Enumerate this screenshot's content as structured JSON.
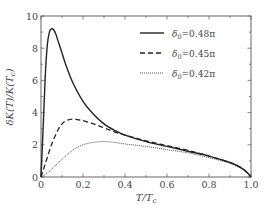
{
  "chart_data": {
    "type": "line",
    "title": "",
    "xlabel": "T/T_c",
    "ylabel": "δK(T)/K(T_c)",
    "xlim": [
      0,
      1.0
    ],
    "ylim": [
      0,
      10
    ],
    "xticks": [
      "0",
      "0.2",
      "0.4",
      "0.6",
      "0.8",
      "1.0"
    ],
    "yticks": [
      "0",
      "2",
      "4",
      "6",
      "8",
      "10"
    ],
    "grid": false,
    "legend_position": "upper right",
    "series": [
      {
        "name": "δ0=0.48π",
        "style": "solid",
        "x": [
          0,
          0.01,
          0.02,
          0.03,
          0.04,
          0.05,
          0.06,
          0.07,
          0.08,
          0.1,
          0.12,
          0.15,
          0.2,
          0.25,
          0.3,
          0.35,
          0.4,
          0.5,
          0.6,
          0.7,
          0.8,
          0.9,
          0.95,
          0.98,
          1.0
        ],
        "y": [
          0,
          3.0,
          6.2,
          8.2,
          9.0,
          9.2,
          9.15,
          8.9,
          8.5,
          7.7,
          6.9,
          5.9,
          4.7,
          3.9,
          3.3,
          2.9,
          2.6,
          2.2,
          1.9,
          1.6,
          1.3,
          0.9,
          0.6,
          0.3,
          0
        ]
      },
      {
        "name": "δ0=0.45π",
        "style": "dashed",
        "x": [
          0,
          0.02,
          0.05,
          0.08,
          0.1,
          0.12,
          0.15,
          0.18,
          0.2,
          0.25,
          0.3,
          0.35,
          0.4,
          0.5,
          0.6,
          0.7,
          0.8,
          0.9,
          0.95,
          0.98,
          1.0
        ],
        "y": [
          0,
          0.8,
          2.0,
          2.9,
          3.3,
          3.5,
          3.6,
          3.55,
          3.5,
          3.3,
          3.05,
          2.8,
          2.6,
          2.25,
          1.95,
          1.65,
          1.3,
          0.9,
          0.6,
          0.3,
          0
        ]
      },
      {
        "name": "δ0=0.42π",
        "style": "dotted",
        "x": [
          0,
          0.03,
          0.06,
          0.1,
          0.15,
          0.2,
          0.25,
          0.3,
          0.35,
          0.4,
          0.5,
          0.6,
          0.7,
          0.8,
          0.9,
          0.95,
          0.98,
          1.0
        ],
        "y": [
          0,
          0.25,
          0.6,
          1.1,
          1.65,
          2.0,
          2.15,
          2.2,
          2.15,
          2.05,
          1.9,
          1.7,
          1.5,
          1.2,
          0.85,
          0.55,
          0.3,
          0
        ]
      }
    ]
  },
  "legend": {
    "entries": [
      {
        "label": "δ",
        "sub": "0",
        "value": "=0.48π"
      },
      {
        "label": "δ",
        "sub": "0",
        "value": "=0.45π"
      },
      {
        "label": "δ",
        "sub": "0",
        "value": "=0.42π"
      }
    ]
  },
  "axes": {
    "xlabel_main": "T/T",
    "xlabel_sub": "c",
    "ylabel_text": "δK(T)/K(T",
    "ylabel_sub": "c",
    "ylabel_close": ")"
  },
  "colors": {
    "line": "#222222",
    "axis": "#555555",
    "text": "#444444"
  }
}
